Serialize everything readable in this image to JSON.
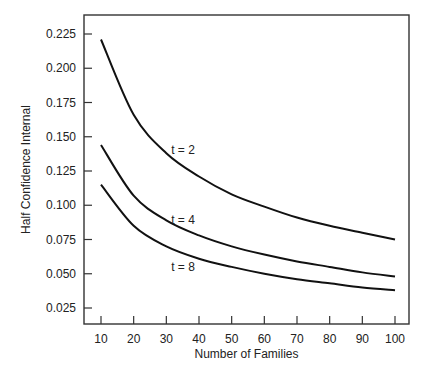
{
  "chart_data": {
    "type": "line",
    "title": "",
    "xlabel": "Number of Families",
    "ylabel": "Half Confidence Internal",
    "x": [
      10,
      20,
      30,
      40,
      50,
      60,
      70,
      80,
      90,
      100
    ],
    "xticks": [
      "10",
      "20",
      "30",
      "40",
      "50",
      "60",
      "70",
      "80",
      "90",
      "100"
    ],
    "yticks": [
      "0.025",
      "0.050",
      "0.075",
      "0.100",
      "0.125",
      "0.150",
      "0.175",
      "0.200",
      "0.225"
    ],
    "xlim": [
      5,
      105
    ],
    "ylim": [
      0.0125,
      0.2365
    ],
    "grid": false,
    "legend": "inline labels",
    "series": [
      {
        "name": "t = 2",
        "values": [
          0.221,
          0.166,
          0.138,
          0.121,
          0.108,
          0.099,
          0.091,
          0.085,
          0.08,
          0.075
        ]
      },
      {
        "name": "t = 4",
        "values": [
          0.144,
          0.107,
          0.089,
          0.078,
          0.07,
          0.064,
          0.059,
          0.055,
          0.051,
          0.048
        ]
      },
      {
        "name": "t = 8",
        "values": [
          0.115,
          0.085,
          0.07,
          0.061,
          0.055,
          0.05,
          0.046,
          0.043,
          0.04,
          0.038
        ]
      }
    ],
    "annotations": [
      {
        "text": "t = 2",
        "x": 33,
        "y": 0.14
      },
      {
        "text": "t = 4",
        "x": 33,
        "y": 0.089
      },
      {
        "text": "t = 8",
        "x": 33,
        "y": 0.055
      }
    ]
  }
}
